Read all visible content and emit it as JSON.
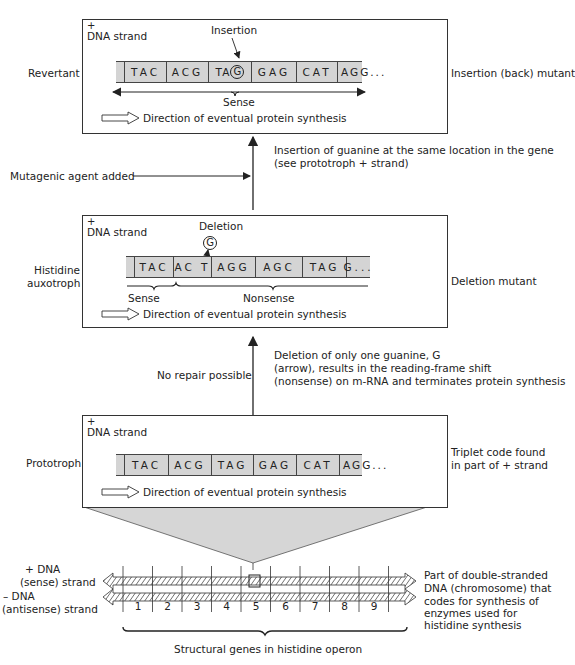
{
  "revertant_panel": {
    "plus": "+",
    "strand_label": "DNA strand",
    "side_label_left": "Revertant",
    "side_label_right": "Insertion (back) mutant",
    "annotation": "Insertion",
    "codons": [
      "TAC",
      "ACG",
      "TA",
      "GAG",
      "CAT",
      "AGG..."
    ],
    "inserted_base": "G",
    "reading_label": "Sense",
    "direction": "Direction of eventual protein synthesis"
  },
  "step_upper": {
    "left": "Mutagenic agent added",
    "right_lines": [
      "Insertion of guanine at the same location in the gene",
      "(see prototroph + strand)"
    ]
  },
  "auxotroph_panel": {
    "plus": "+",
    "strand_label": "DNA strand",
    "side_label_left_lines": [
      "Histidine",
      "auxotroph"
    ],
    "side_label_right": "Deletion mutant",
    "annotation": "Deletion",
    "deleted_base": "G",
    "codons": [
      "TAC",
      "AC T",
      "AGG",
      "AGC",
      "TAG",
      "G..."
    ],
    "sense_label": "Sense",
    "nonsense_label": "Nonsense",
    "direction": "Direction of eventual protein synthesis"
  },
  "step_lower": {
    "left": "No repair possible",
    "right_lines": [
      "Deletion of only one guanine, G",
      "(arrow), results in the reading-frame shift",
      "(nonsense) on m-RNA and terminates protein synthesis"
    ]
  },
  "prototroph_panel": {
    "plus": "+",
    "strand_label": "DNA strand",
    "side_label_left": "Prototroph",
    "side_label_right_lines": [
      "Triplet code found",
      "in part of + strand"
    ],
    "codons": [
      "TAC",
      "ACG",
      "TAG",
      "GAG",
      "CAT",
      "AGG..."
    ],
    "direction": "Direction of eventual protein synthesis"
  },
  "chromosome": {
    "plus_strand_lines": [
      "+ DNA",
      "(sense) strand"
    ],
    "minus_strand_lines": [
      "– DNA",
      "(antisense) strand"
    ],
    "genes": [
      "1",
      "2",
      "3",
      "4",
      "5",
      "6",
      "7",
      "8",
      "9"
    ],
    "highlighted_gene": "5",
    "right_lines": [
      "Part of double-stranded",
      "DNA (chromosome) that",
      "codes for synthesis of",
      "enzymes used for",
      "histidine synthesis"
    ],
    "bottom_label": "Structural genes in histidine operon"
  }
}
